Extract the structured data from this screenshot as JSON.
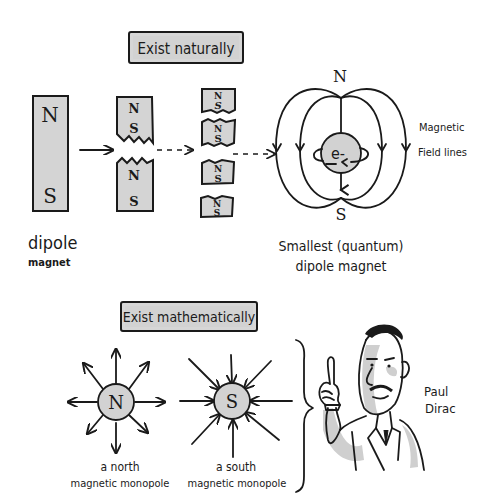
{
  "sections": {
    "natural": {
      "heading": "Exist naturally",
      "dipole_magnet": {
        "north": "N",
        "south": "S",
        "caption_line1": "dipole",
        "caption_line2": "magnet"
      },
      "split_once": {
        "pieces": [
          {
            "north": "N",
            "south": "S"
          },
          {
            "north": "N",
            "south": "S"
          }
        ]
      },
      "split_again": {
        "pieces": [
          {
            "north": "N",
            "south": "S"
          },
          {
            "north": "N",
            "south": "S"
          },
          {
            "north": "N",
            "south": "S"
          },
          {
            "north": "N",
            "south": "S"
          }
        ]
      },
      "electron": {
        "symbol": "e-",
        "pole_north": "N",
        "pole_south": "S",
        "field_label_line1": "Magnetic",
        "field_label_line2": "Field lines",
        "caption_line1": "Smallest (quantum)",
        "caption_line2": "dipole magnet"
      }
    },
    "mathematical": {
      "heading": "Exist mathematically",
      "north_monopole": {
        "symbol": "N",
        "caption_line1": "a north",
        "caption_line2": "magnetic monopole"
      },
      "south_monopole": {
        "symbol": "S",
        "caption_line1": "a south",
        "caption_line2": "magnetic monopole"
      },
      "person": {
        "name_line1": "Paul",
        "name_line2": "Dirac"
      }
    }
  },
  "colors": {
    "ink": "#1a1a1a",
    "fill_gray": "#d4d4d4",
    "background": "#ffffff"
  }
}
